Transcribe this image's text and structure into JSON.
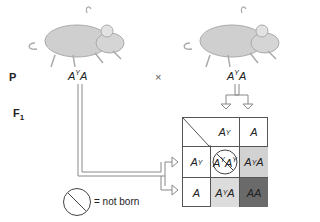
{
  "generations": {
    "p_label": "P",
    "f1_label": "F",
    "f1_sub": "1"
  },
  "parents": {
    "left": {
      "genotype_base": "A",
      "genotype_sup": "Y",
      "genotype_tail": "A"
    },
    "cross_symbol": "×",
    "right": {
      "genotype_base": "A",
      "genotype_sup": "Y",
      "genotype_tail": "A"
    }
  },
  "punnett": {
    "col_headers": [
      {
        "base": "A",
        "sup": "Y"
      },
      {
        "base": "A",
        "sup": ""
      }
    ],
    "row_headers": [
      {
        "base": "A",
        "sup": "Y"
      },
      {
        "base": "A",
        "sup": ""
      }
    ],
    "cells": [
      [
        {
          "a": "A",
          "s1": "Y",
          "b": "A",
          "s2": "Y",
          "crossed": true,
          "color": "#ffffff"
        },
        {
          "a": "A",
          "s1": "Y",
          "b": "A",
          "s2": "",
          "crossed": false,
          "color": "#d2d2d2"
        }
      ],
      [
        {
          "a": "A",
          "s1": "Y",
          "b": "A",
          "s2": "",
          "crossed": false,
          "color": "#dcdcdc"
        },
        {
          "a": "A",
          "s1": "",
          "b": "A",
          "s2": "",
          "crossed": false,
          "color": "#6a6a6a"
        }
      ]
    ]
  },
  "legend": {
    "text": "= not born"
  },
  "colors": {
    "grid": "#555555",
    "arrow": "#777777"
  }
}
